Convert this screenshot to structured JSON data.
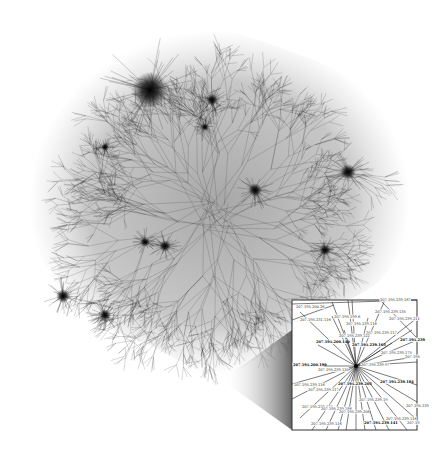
{
  "figure": {
    "type": "network-map",
    "background": "#ffffff",
    "ink_color": "#1a1a1a",
    "main_graph": {
      "center": [
        215,
        215
      ],
      "hubs": [
        {
          "x": 150,
          "y": 90,
          "r": 18
        },
        {
          "x": 348,
          "y": 172,
          "r": 8
        },
        {
          "x": 212,
          "y": 100,
          "r": 6
        },
        {
          "x": 145,
          "y": 242,
          "r": 5
        },
        {
          "x": 165,
          "y": 246,
          "r": 6
        },
        {
          "x": 63,
          "y": 296,
          "r": 7
        },
        {
          "x": 105,
          "y": 315,
          "r": 6
        },
        {
          "x": 255,
          "y": 190,
          "r": 7
        },
        {
          "x": 325,
          "y": 250,
          "r": 6
        },
        {
          "x": 105,
          "y": 147,
          "r": 4
        },
        {
          "x": 205,
          "y": 127,
          "r": 4
        }
      ]
    },
    "inset": {
      "x": 292,
      "y": 300,
      "width": 125,
      "height": 130,
      "hub": [
        356,
        366
      ],
      "callout_apex": [
        222,
        380
      ],
      "labels": [
        {
          "text": "207.195.200.26",
          "x": 296,
          "y": 308,
          "bold": false
        },
        {
          "text": "207.195.231.116",
          "x": 300,
          "y": 321,
          "bold": false
        },
        {
          "text": "207.195.199.6",
          "x": 334,
          "y": 318,
          "bold": false
        },
        {
          "text": "207.195.239.135",
          "x": 375,
          "y": 313,
          "bold": false
        },
        {
          "text": "207.195.239.116",
          "x": 346,
          "y": 325,
          "bold": false
        },
        {
          "text": "207.195.239.211",
          "x": 389,
          "y": 320,
          "bold": false
        },
        {
          "text": "207.195.239.117",
          "x": 366,
          "y": 334,
          "bold": false
        },
        {
          "text": "207.195.239.122",
          "x": 339,
          "y": 337,
          "bold": false
        },
        {
          "text": "207.195.200.140",
          "x": 316,
          "y": 343,
          "bold": true
        },
        {
          "text": "207.195.239.163",
          "x": 352,
          "y": 346,
          "bold": true
        },
        {
          "text": "207.195.239",
          "x": 400,
          "y": 341,
          "bold": true
        },
        {
          "text": "207.195.239.175",
          "x": 381,
          "y": 354,
          "bold": false
        },
        {
          "text": "207.195",
          "x": 405,
          "y": 358,
          "bold": false
        },
        {
          "text": "207.195.200.199",
          "x": 293,
          "y": 366,
          "bold": true
        },
        {
          "text": "207.195.239.97",
          "x": 361,
          "y": 366,
          "bold": false
        },
        {
          "text": "207.195.239.120",
          "x": 318,
          "y": 371,
          "bold": false
        },
        {
          "text": "207.195.239.116",
          "x": 294,
          "y": 386,
          "bold": false
        },
        {
          "text": "207.195.239.203",
          "x": 338,
          "y": 385,
          "bold": true
        },
        {
          "text": "207.195.239.184",
          "x": 380,
          "y": 383,
          "bold": true
        },
        {
          "text": "207.195.239.117",
          "x": 308,
          "y": 391,
          "bold": false
        },
        {
          "text": "207.195.239.19",
          "x": 359,
          "y": 401,
          "bold": false
        },
        {
          "text": "207.195.239.127",
          "x": 302,
          "y": 408,
          "bold": false
        },
        {
          "text": "207.195.239.186",
          "x": 321,
          "y": 410,
          "bold": false
        },
        {
          "text": "207.195.239.208",
          "x": 339,
          "y": 413,
          "bold": false
        },
        {
          "text": "207.195.239",
          "x": 406,
          "y": 407,
          "bold": false
        },
        {
          "text": "207.195.239.116",
          "x": 311,
          "y": 425,
          "bold": false
        },
        {
          "text": "207.195.239.141",
          "x": 364,
          "y": 424,
          "bold": true
        },
        {
          "text": "207.195.239.116",
          "x": 386,
          "y": 420,
          "bold": false
        },
        {
          "text": "207.19",
          "x": 407,
          "y": 424,
          "bold": false
        },
        {
          "text": "207.195.239.167",
          "x": 380,
          "y": 301,
          "bold": false
        }
      ],
      "spokes": [
        [
          300,
          312
        ],
        [
          332,
          302
        ],
        [
          348,
          300
        ],
        [
          352,
          300
        ],
        [
          385,
          300
        ],
        [
          417,
          318
        ],
        [
          412,
          330
        ],
        [
          417,
          340
        ],
        [
          392,
          343
        ],
        [
          408,
          358
        ],
        [
          417,
          362
        ],
        [
          417,
          385
        ],
        [
          417,
          402
        ],
        [
          415,
          418
        ],
        [
          407,
          430
        ],
        [
          389,
          430
        ],
        [
          376,
          430
        ],
        [
          365,
          430
        ],
        [
          356,
          430
        ],
        [
          346,
          430
        ],
        [
          338,
          430
        ],
        [
          326,
          430
        ],
        [
          312,
          430
        ],
        [
          300,
          418
        ],
        [
          292,
          399
        ],
        [
          292,
          384
        ],
        [
          292,
          366
        ],
        [
          318,
          345
        ],
        [
          344,
          330
        ],
        [
          332,
          316
        ],
        [
          368,
          318
        ]
      ],
      "extra_edges": [
        [
          [
            292,
            304
          ],
          [
            417,
            300
          ]
        ],
        [
          [
            292,
            320
          ],
          [
            334,
            305
          ]
        ],
        [
          [
            380,
            300
          ],
          [
            417,
            338
          ]
        ]
      ]
    }
  }
}
